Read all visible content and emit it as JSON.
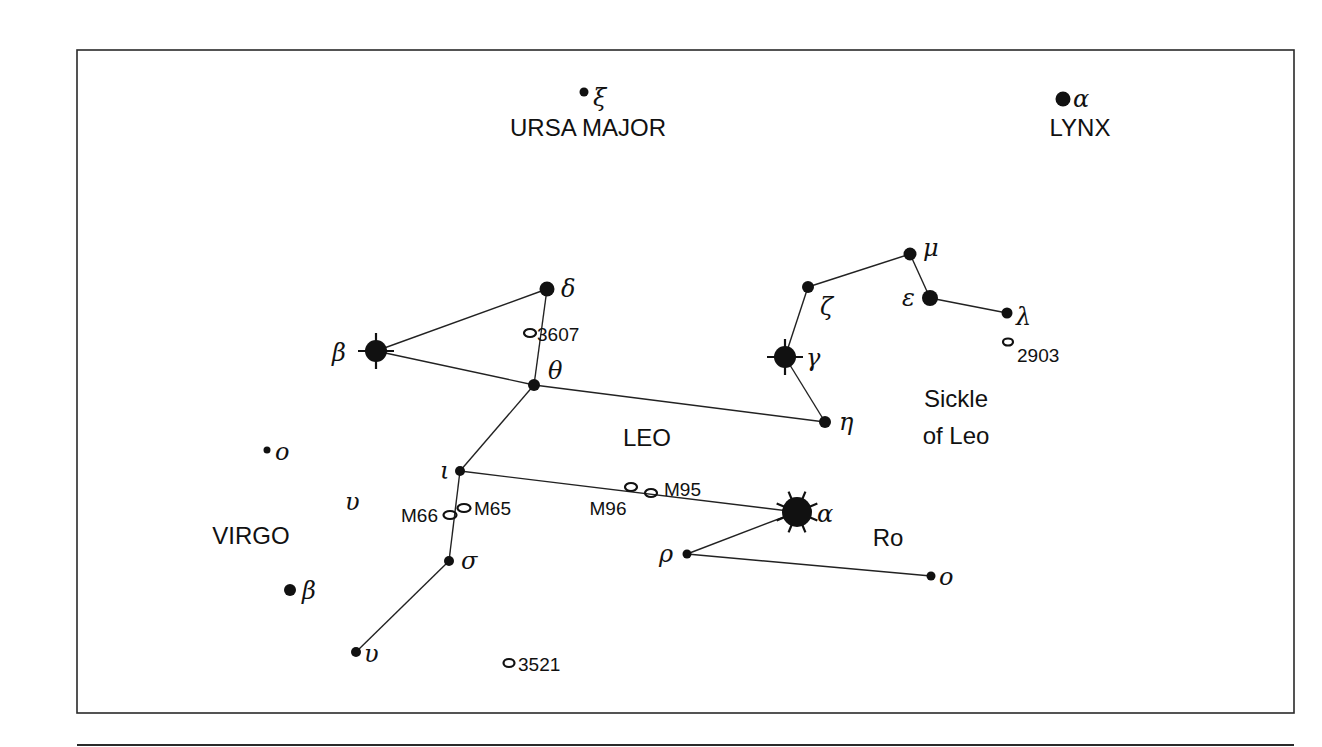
{
  "chart_data": {
    "type": "star-chart",
    "title": "",
    "constellations": [
      {
        "name": "URSA MAJOR",
        "label_pos": [
          588,
          136
        ]
      },
      {
        "name": "LYNX",
        "label_pos": [
          1080,
          136
        ]
      },
      {
        "name": "LEO",
        "label_pos": [
          647,
          446
        ]
      },
      {
        "name": "VIRGO",
        "label_pos": [
          251,
          544
        ]
      }
    ],
    "annotations": [
      {
        "text": "Sickle",
        "pos": [
          956,
          407
        ]
      },
      {
        "text": "of Leo",
        "pos": [
          956,
          444
        ]
      },
      {
        "text": "Ro",
        "pos": [
          888,
          546
        ]
      }
    ],
    "stars": [
      {
        "id": "uma-xi",
        "greek": "ξ",
        "constellation": "Ursa Major",
        "x": 584,
        "y": 92,
        "r": 4.5,
        "type": "dot",
        "label_dx": 9,
        "label_dy": 14
      },
      {
        "id": "lyn-alpha",
        "greek": "α",
        "constellation": "Lynx",
        "x": 1063,
        "y": 99,
        "r": 7.5,
        "type": "dot",
        "label_dx": 10,
        "label_dy": 8
      },
      {
        "id": "leo-delta",
        "greek": "δ",
        "constellation": "Leo",
        "x": 547,
        "y": 289,
        "r": 7.5,
        "type": "dot",
        "label_dx": 14,
        "label_dy": 8
      },
      {
        "id": "leo-beta",
        "greek": "β",
        "constellation": "Leo",
        "x": 376,
        "y": 351,
        "r": 11,
        "type": "cross",
        "label_dx": -44,
        "label_dy": 10
      },
      {
        "id": "leo-theta",
        "greek": "θ",
        "constellation": "Leo",
        "x": 534,
        "y": 385,
        "r": 6,
        "type": "dot",
        "label_dx": 14,
        "label_dy": -6
      },
      {
        "id": "leo-mu",
        "greek": "μ",
        "constellation": "Leo",
        "x": 910,
        "y": 254,
        "r": 6.5,
        "type": "dot",
        "label_dx": 13,
        "label_dy": 2
      },
      {
        "id": "leo-zeta",
        "greek": "ζ",
        "constellation": "Leo",
        "x": 808,
        "y": 287,
        "r": 6,
        "type": "dot",
        "label_dx": 12,
        "label_dy": 28
      },
      {
        "id": "leo-epsilon",
        "greek": "ε",
        "constellation": "Leo",
        "x": 930,
        "y": 298,
        "r": 8,
        "type": "dot",
        "label_dx": -28,
        "label_dy": 8
      },
      {
        "id": "leo-lambda",
        "greek": "λ",
        "constellation": "Leo",
        "x": 1007,
        "y": 313,
        "r": 5.5,
        "type": "dot",
        "label_dx": 9,
        "label_dy": 12
      },
      {
        "id": "leo-gamma",
        "greek": "γ",
        "constellation": "Leo",
        "x": 785,
        "y": 357,
        "r": 11,
        "type": "cross",
        "label_dx": 21,
        "label_dy": 9
      },
      {
        "id": "leo-eta",
        "greek": "η",
        "constellation": "Leo",
        "x": 825,
        "y": 422,
        "r": 6,
        "type": "dot",
        "label_dx": 14,
        "label_dy": 8
      },
      {
        "id": "leo-iota",
        "greek": "ι",
        "constellation": "Leo",
        "x": 460,
        "y": 471,
        "r": 5,
        "type": "dot",
        "label_dx": -20,
        "label_dy": 8
      },
      {
        "id": "leo-sigma",
        "greek": "σ",
        "constellation": "Leo",
        "x": 449,
        "y": 561,
        "r": 5,
        "type": "dot",
        "label_dx": 12,
        "label_dy": 8
      },
      {
        "id": "leo-rho",
        "greek": "ρ",
        "constellation": "Leo",
        "x": 687,
        "y": 554,
        "r": 4.5,
        "type": "dot",
        "label_dx": -28,
        "label_dy": 8
      },
      {
        "id": "leo-alpha",
        "greek": "α",
        "constellation": "Leo",
        "x": 797,
        "y": 512,
        "r": 15,
        "type": "burst",
        "label_dx": 20,
        "label_dy": 10
      },
      {
        "id": "leo-omicron",
        "greek": "o",
        "constellation": "Leo",
        "x": 931,
        "y": 576,
        "r": 4.5,
        "type": "dot",
        "label_dx": 8,
        "label_dy": 9
      },
      {
        "id": "vir-omicron",
        "greek": "o",
        "constellation": "Virgo",
        "x": 267,
        "y": 450,
        "r": 3.5,
        "type": "dot",
        "label_dx": 8,
        "label_dy": 10
      },
      {
        "id": "vir-beta",
        "greek": "β",
        "constellation": "Virgo",
        "x": 290,
        "y": 590,
        "r": 6,
        "type": "dot",
        "label_dx": 12,
        "label_dy": 9
      },
      {
        "id": "vir-upsilon",
        "greek": "υ",
        "constellation": "Virgo",
        "x": 356,
        "y": 652,
        "r": 5,
        "type": "dot",
        "label_dx": 8,
        "label_dy": 10
      }
    ],
    "free_labels": [
      {
        "text": "υ",
        "x": 345,
        "y": 510,
        "class": "greek"
      }
    ],
    "lines": [
      [
        "leo-beta",
        "leo-delta"
      ],
      [
        "leo-beta",
        "leo-theta"
      ],
      [
        "leo-delta",
        "leo-theta"
      ],
      [
        "leo-theta",
        "leo-eta"
      ],
      [
        "leo-eta",
        "leo-gamma"
      ],
      [
        "leo-gamma",
        "leo-zeta"
      ],
      [
        "leo-zeta",
        "leo-mu"
      ],
      [
        "leo-mu",
        "leo-epsilon"
      ],
      [
        "leo-epsilon",
        "leo-lambda"
      ],
      [
        "leo-theta",
        "leo-iota"
      ],
      [
        "leo-iota",
        "leo-alpha"
      ],
      [
        "leo-iota",
        "leo-sigma"
      ],
      [
        "leo-sigma",
        "vir-upsilon"
      ],
      [
        "leo-alpha",
        "leo-rho"
      ],
      [
        "leo-rho",
        "leo-omicron"
      ]
    ],
    "deep_sky_objects": [
      {
        "id": "NGC 3607",
        "label": "3607",
        "x": 530,
        "y": 333,
        "rx": 6,
        "ry": 4,
        "label_x": 537,
        "label_y": 341,
        "anchor": "start"
      },
      {
        "id": "NGC 2903",
        "label": "2903",
        "x": 1008,
        "y": 342,
        "rx": 5,
        "ry": 3.5,
        "label_x": 1017,
        "label_y": 362,
        "anchor": "start"
      },
      {
        "id": "M65",
        "label": "M65",
        "x": 464,
        "y": 508,
        "rx": 6.5,
        "ry": 4,
        "label_x": 474,
        "label_y": 515,
        "anchor": "start"
      },
      {
        "id": "M66",
        "label": "M66",
        "x": 450,
        "y": 515,
        "rx": 6.5,
        "ry": 4,
        "label_x": 438,
        "label_y": 522,
        "anchor": "end"
      },
      {
        "id": "M96",
        "label": "M96",
        "x": 631,
        "y": 487,
        "rx": 6,
        "ry": 4,
        "label_x": 608,
        "label_y": 515,
        "anchor": "middle"
      },
      {
        "id": "M95",
        "label": "M95",
        "x": 651,
        "y": 493,
        "rx": 6,
        "ry": 4,
        "label_x": 664,
        "label_y": 496,
        "anchor": "start"
      },
      {
        "id": "NGC 3521",
        "label": "3521",
        "x": 509,
        "y": 663,
        "rx": 5.5,
        "ry": 4,
        "label_x": 518,
        "label_y": 671,
        "anchor": "start"
      }
    ],
    "frame": {
      "x": 77,
      "y": 50,
      "width": 1217,
      "height": 663
    },
    "rule": {
      "x1": 77,
      "x2": 1294,
      "y": 745
    },
    "grid": false
  }
}
